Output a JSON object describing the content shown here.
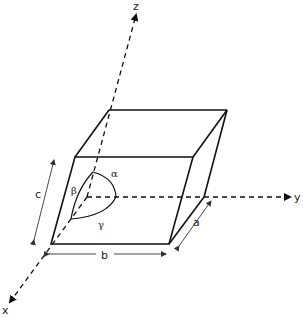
{
  "diagram": {
    "axes": {
      "x": "x",
      "y": "y",
      "z": "z"
    },
    "edges": {
      "a": "a",
      "b": "b",
      "c": "c"
    },
    "angles": {
      "alpha": "α",
      "beta": "β",
      "gamma": "γ"
    },
    "colors": {
      "line": "#111111",
      "background": "#ffffff"
    }
  }
}
